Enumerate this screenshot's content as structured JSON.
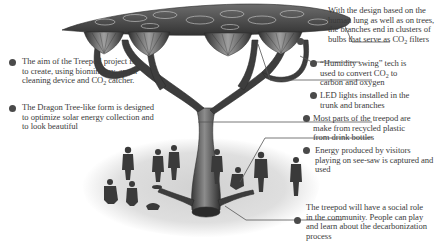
{
  "diagram": {
    "subject": "Treepod",
    "colors": {
      "text": "#3b3b3b",
      "bullet": "#4a4a4a",
      "line": "#555555",
      "ground": "#cfcfcf"
    },
    "left_notes": [
      {
        "id": "aim",
        "text_before_sub": "The aim of the Treepod project is to create, using biomimicry, an air cleaning device and CO",
        "sub": "2",
        "text_after_sub": " catcher."
      },
      {
        "id": "dragon-tree-form",
        "text": "The Dragon Tree-like form is designed to optimize solar energy collection and to look beautiful"
      }
    ],
    "right_notes": [
      {
        "id": "lung-design",
        "text_before_sub": "With the design based on the human lung as well as on trees, the branches end in clusters of bulbs that serve as CO",
        "sub": "2",
        "text_after_sub": " filters"
      },
      {
        "id": "humidity-swing",
        "text_before_sub": "“Humidity swing” tech is used to convert CO",
        "sub": "2",
        "text_after_sub": " to carbon and oxygen"
      },
      {
        "id": "led-lights",
        "text": "LED lights installed in the trunk and branches"
      },
      {
        "id": "recycled-plastic",
        "text": "Most parts of the treepod are make from recycled plastic from drink bottles"
      },
      {
        "id": "see-saw-energy",
        "text": "Energy produced by visitors playing on see-saw is captured and used"
      },
      {
        "id": "social-role",
        "text": "The treepod will have a social role in the community. People can play and learn about the decarbonization process"
      }
    ]
  }
}
